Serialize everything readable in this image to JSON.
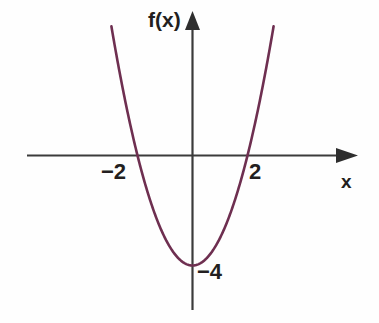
{
  "figure": {
    "kind": "cartesian-graph",
    "background_color": "#fefefe",
    "curve_color": "#6e2f50",
    "axis_color": "#3b3b3b"
  },
  "labels": {
    "y_axis": "f(x)",
    "x_axis": "x",
    "root_left": "−2",
    "root_right": "2",
    "vertex": "−4"
  },
  "chart_data": {
    "type": "line",
    "title": "",
    "subtitle": "",
    "xlabel": "x",
    "ylabel": "f(x)",
    "function": "f(x) = x^2 - 4",
    "grid": false,
    "legend": null,
    "xlim": [
      -6,
      6
    ],
    "ylim": [
      -5.2,
      5.2
    ],
    "xticks": [
      -2,
      2
    ],
    "xticklabels": [
      "−2",
      "2"
    ],
    "yticks": [
      -4
    ],
    "yticklabels": [
      "−4"
    ],
    "annotations": [
      {
        "text": "f(x)",
        "role": "y-axis-name"
      },
      {
        "text": "x",
        "role": "x-axis-name"
      },
      {
        "text": "−2",
        "role": "x-intercept-left"
      },
      {
        "text": "2",
        "role": "x-intercept-right"
      },
      {
        "text": "−4",
        "role": "vertex-y-value"
      }
    ],
    "roots": [
      -2,
      2
    ],
    "vertex": [
      0,
      -4
    ],
    "series": [
      {
        "name": "f(x) = x^2 - 4",
        "color": "#6e2f50",
        "x": [
          -2.95,
          -2.8,
          -2.6,
          -2.4,
          -2.2,
          -2.0,
          -1.8,
          -1.6,
          -1.4,
          -1.2,
          -1.0,
          -0.8,
          -0.6,
          -0.4,
          -0.2,
          0.0,
          0.2,
          0.4,
          0.6,
          0.8,
          1.0,
          1.2,
          1.4,
          1.6,
          1.8,
          2.0,
          2.2,
          2.4,
          2.6,
          2.8,
          2.95
        ],
        "y": [
          4.7,
          3.84,
          2.76,
          1.76,
          0.84,
          0.0,
          -0.76,
          -1.44,
          -2.04,
          -2.56,
          -3.0,
          -3.36,
          -3.64,
          -3.84,
          -3.96,
          -4.0,
          -3.96,
          -3.84,
          -3.64,
          -3.36,
          -3.0,
          -2.56,
          -2.04,
          -1.44,
          -0.76,
          0.0,
          0.84,
          1.76,
          2.76,
          3.84,
          4.7
        ]
      }
    ]
  }
}
